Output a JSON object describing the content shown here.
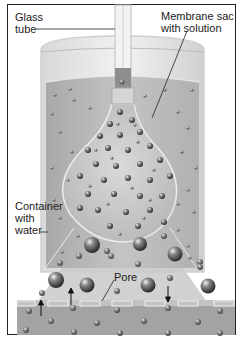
{
  "labels": {
    "glass_tube": [
      "Glass",
      "tube"
    ],
    "membrane_sac": [
      "Membrane sac",
      "with solution"
    ],
    "container": [
      "Container",
      "with",
      "water"
    ],
    "pore": "Pore"
  },
  "colors": {
    "water": "#b9b9b9",
    "glass": "#e6e6e6",
    "bottom_water": "#a3a3a3",
    "sac_fill": "#c8c8c8",
    "molecule_large": "#555555",
    "molecule_small": "#777777"
  },
  "arrows": [
    {
      "x": 41,
      "direction": "up"
    },
    {
      "x": 71,
      "direction": "up"
    },
    {
      "x": 168,
      "direction": "down"
    }
  ]
}
